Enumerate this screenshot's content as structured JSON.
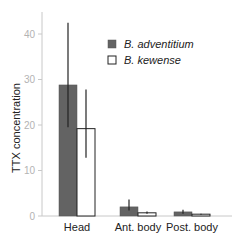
{
  "chart_data": {
    "type": "bar",
    "title": "",
    "xlabel": "",
    "ylabel": "TTX concentration",
    "ylim": [
      0,
      42
    ],
    "yticks": [
      0,
      10,
      20,
      30,
      40
    ],
    "grid": false,
    "legend_position": "top-right",
    "categories": [
      "Head",
      "Ant. body",
      "Post. body"
    ],
    "series": [
      {
        "name": "B. adventitium",
        "color": "#636363",
        "values": [
          28.8,
          2.0,
          0.9
        ],
        "error_low": [
          19.5,
          1.2,
          0.5
        ],
        "error_high": [
          42.5,
          3.6,
          1.4
        ]
      },
      {
        "name": "B. kewense",
        "color": "#ffffff",
        "values": [
          19.2,
          0.7,
          0.4
        ],
        "error_low": [
          12.8,
          0.5,
          0.3
        ],
        "error_high": [
          27.8,
          1.0,
          0.5
        ]
      }
    ]
  },
  "axis": {
    "ylabel": "TTX concentration",
    "yticks": [
      "0",
      "10",
      "20",
      "30",
      "40"
    ]
  },
  "legend": {
    "items": [
      {
        "label": "B. adventitium"
      },
      {
        "label": "B. kewense"
      }
    ]
  },
  "categories": [
    "Head",
    "Ant. body",
    "Post. body"
  ]
}
